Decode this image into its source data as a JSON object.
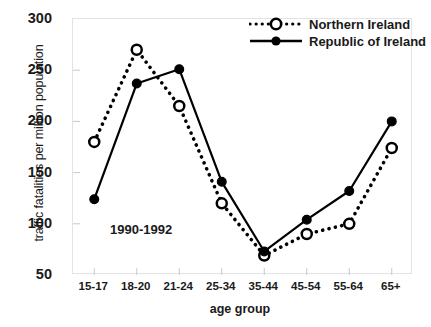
{
  "chart_data": {
    "type": "line",
    "title": "",
    "subtitle": "",
    "annotation": "1990-1992",
    "xlabel": "age group",
    "ylabel": "traffic fatalities per million population",
    "categories": [
      "15-17",
      "18-20",
      "21-24",
      "25-34",
      "35-44",
      "45-54",
      "55-64",
      "65+"
    ],
    "ylim": [
      50,
      300
    ],
    "yticks": [
      50,
      100,
      150,
      200,
      250,
      300
    ],
    "grid": false,
    "legend_position": "top-right",
    "series": [
      {
        "name": "Northern Ireland",
        "values": [
          180,
          270,
          215,
          120,
          69,
          90,
          100,
          174
        ],
        "line_style": "dotted",
        "marker": "open-circle",
        "color": "#000000"
      },
      {
        "name": "Republic of Ireland",
        "values": [
          124,
          237,
          251,
          141,
          73,
          104,
          132,
          200
        ],
        "line_style": "solid",
        "marker": "filled-circle",
        "color": "#000000"
      }
    ]
  },
  "legend": {
    "items": [
      {
        "label": "Northern Ireland",
        "marker": "open-circle-dotted"
      },
      {
        "label": "Republic of Ireland",
        "marker": "filled-circle-solid"
      }
    ]
  },
  "axis": {
    "y_tick_labels": [
      "300",
      "250",
      "200",
      "150",
      "100",
      "50"
    ],
    "x_tick_labels": [
      "15-17",
      "18-20",
      "21-24",
      "25-34",
      "35-44",
      "45-54",
      "55-64",
      "65+"
    ]
  }
}
